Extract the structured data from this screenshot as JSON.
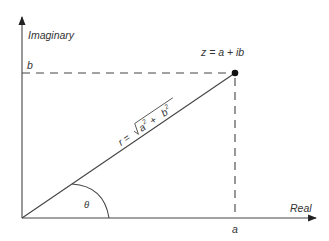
{
  "diagram": {
    "axes": {
      "x_label": "Real",
      "y_label": "Imaginary"
    },
    "point_label": "z = a + ib",
    "real_part_label": "a",
    "imag_part_label": "b",
    "modulus_label": "r = √a² + b²",
    "modulus_parts": {
      "r": "r = ",
      "a": "a",
      "plus": " + ",
      "b": "b",
      "exp": "2"
    },
    "angle_label": "θ",
    "colors": {
      "line": "#333333",
      "point": "#111111",
      "text": "#333333"
    }
  }
}
